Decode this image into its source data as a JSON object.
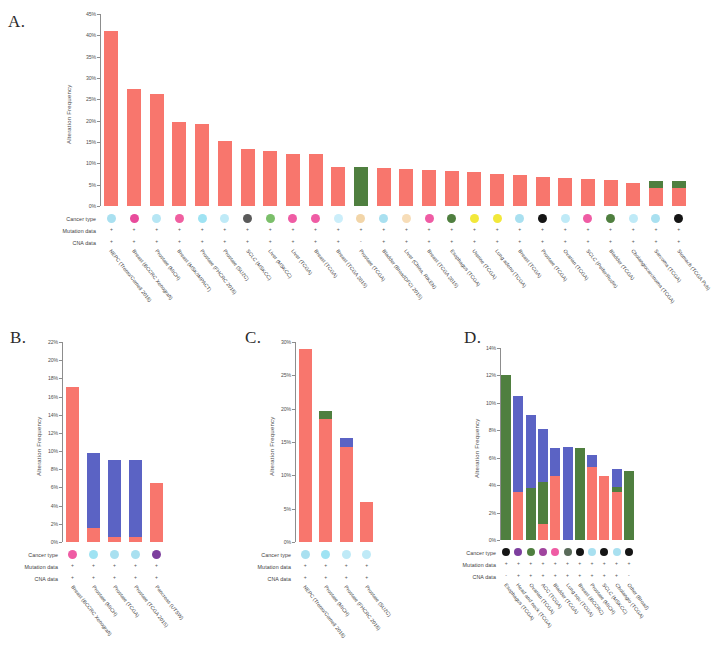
{
  "figure": {
    "axis_title": "Alteration Frequency",
    "row_labels": {
      "cancer_type": "Cancer type",
      "mutation_data": "Mutation data",
      "cna_data": "CNA data"
    },
    "present_mark": "+",
    "absent_mark": "-",
    "colors": {
      "mutation": "#f8766d",
      "amplification": "#4f7f3f",
      "deletion": "#5b63c4",
      "axis": "#8d8d8d",
      "text": "#3c3c3c"
    },
    "legend_meaning": {
      "orange": "Mutation",
      "green": "Amplification",
      "blue": "Deep Deletion"
    }
  },
  "panels": [
    {
      "letter": "A.",
      "name": "panel-a",
      "chart_data": {
        "type": "bar",
        "title": "",
        "xlabel": "",
        "ylabel": "Alteration Frequency",
        "ylim": [
          0,
          45
        ],
        "yticks": [
          "0%",
          "5%",
          "10%",
          "15%",
          "20%",
          "25%",
          "30%",
          "35%",
          "40%",
          "45%"
        ],
        "ytick_values": [
          0,
          5,
          10,
          15,
          20,
          25,
          30,
          35,
          40,
          45
        ],
        "grid": false,
        "stacked": true,
        "series": [
          {
            "name": "Mutation",
            "color": "#f8766d",
            "values": [
              41.0,
              27.5,
              26.2,
              19.8,
              19.2,
              15.2,
              13.3,
              13.0,
              12.2,
              12.1,
              9.2,
              0.0,
              9.0,
              8.6,
              8.5,
              8.3,
              8.0,
              7.6,
              7.3,
              6.7,
              6.5,
              6.3,
              6.0,
              5.4,
              4.3,
              4.2
            ]
          },
          {
            "name": "Amplification",
            "color": "#4f7f3f",
            "values": [
              0,
              0,
              0,
              0,
              0,
              0,
              0,
              0,
              0,
              0,
              0,
              9.1,
              0,
              0,
              0,
              0,
              0,
              0,
              0,
              0,
              0,
              0,
              0,
              0,
              1.6,
              1.6
            ]
          },
          {
            "name": "Deep Deletion",
            "color": "#5b63c4",
            "values": [
              0,
              0,
              0,
              0,
              0,
              0,
              0,
              0,
              0,
              0,
              0,
              0,
              0,
              0,
              0,
              0,
              0,
              0,
              0,
              0,
              0,
              0,
              0,
              0,
              0,
              0
            ]
          }
        ],
        "categories": [
          "NEPC (Trento/Cornell 2016)",
          "Breast (BCCRC Xenograft)",
          "Prostate (MICH)",
          "Breast (MSK/IMPACT)",
          "Prostate (FHCRC 2016)",
          "Prostate (SU2C)",
          "SCLC (MSKCC)",
          "Liver (MSKCC)",
          "Liver (TCGA)",
          "Breast (TCGA)",
          "Breast (TCGA 2015)",
          "Prostate (TCGA)",
          "Bladder (BroadDFCI 2015)",
          "Liver (China, RIKEN)",
          "Breast (TCGA 2015)",
          "Esophagus (TCGA)",
          "Uterine (TCGA)",
          "Lung adeno (TCGA)",
          "Breast (TCGA)",
          "Prostate (TCGA)",
          "Ovarian (TCGA)",
          "SCLC (Peifer/Rudin)",
          "Bladder (TCGA)",
          "Cholangiocarcinoma (TCGA)",
          "Sarcoma (TCGA)",
          "Stomach (TCGA Pub)"
        ],
        "cancer_type_colors": [
          "#a9e0f0",
          "#e84b9b",
          "#b6e6f4",
          "#f05fa0",
          "#9fe3f3",
          "#bfeaf7",
          "#5a5a5a",
          "#7bbf6a",
          "#ef5ca4",
          "#ef5ca4",
          "#cbeefa",
          "#f2d5a8",
          "#a9e0f0",
          "#f7ddb8",
          "#ef5ca4",
          "#4f7f3f",
          "#f2e83a",
          "#f2e83a",
          "#a9e0f0",
          "#151515",
          "#bfeaf7",
          "#ef5ca4",
          "#4f7f3f",
          "#bfeaf7",
          "#a9e0f0",
          "#151515"
        ],
        "mutation_data": [
          "+",
          "+",
          "+",
          "+",
          "+",
          "+",
          "+",
          "+",
          "+",
          "+",
          "+",
          "+",
          "+",
          "+",
          "+",
          "+",
          "+",
          "+",
          "+",
          "+",
          "+",
          "+",
          "+",
          "+",
          "+",
          "+"
        ],
        "cna_data": [
          "+",
          "+",
          "+",
          "+",
          "+",
          "+",
          "+",
          "+",
          "+",
          "+",
          "+",
          "-",
          "+",
          "+",
          "+",
          "+",
          "+",
          "+",
          "+",
          "+",
          "+",
          "+",
          "+",
          "+",
          "+",
          "+"
        ]
      }
    },
    {
      "letter": "B.",
      "name": "panel-b",
      "chart_data": {
        "type": "bar",
        "title": "",
        "xlabel": "",
        "ylabel": "Alteration Frequency",
        "ylim": [
          0,
          22
        ],
        "yticks": [
          "0%",
          "2%",
          "4%",
          "6%",
          "8%",
          "10%",
          "12%",
          "14%",
          "16%",
          "18%",
          "20%",
          "22%"
        ],
        "ytick_values": [
          0,
          2,
          4,
          6,
          8,
          10,
          12,
          14,
          16,
          18,
          20,
          22
        ],
        "grid": false,
        "stacked": true,
        "series": [
          {
            "name": "Mutation",
            "color": "#f8766d",
            "values": [
              17.0,
              1.5,
              0.6,
              0.6,
              6.5
            ]
          },
          {
            "name": "Amplification",
            "color": "#4f7f3f",
            "values": [
              0,
              0,
              0,
              0,
              0
            ]
          },
          {
            "name": "Deep Deletion",
            "color": "#5b63c4",
            "values": [
              0,
              8.3,
              8.4,
              8.4,
              0
            ]
          }
        ],
        "categories": [
          "Breast (BCCRC Xenograft)",
          "Prostate (MICH)",
          "Prostate (TCGA)",
          "Prostate (TCGA 2015)",
          "Pancreas (UTSW)"
        ],
        "cancer_type_colors": [
          "#ef5ca4",
          "#9fe3f3",
          "#a9e0f0",
          "#a9e0f0",
          "#7d3f9e"
        ],
        "mutation_data": [
          "+",
          "+",
          "+",
          "+",
          "+"
        ],
        "cna_data": [
          "+",
          "+",
          "+",
          "+",
          "+"
        ]
      }
    },
    {
      "letter": "C.",
      "name": "panel-c",
      "chart_data": {
        "type": "bar",
        "title": "",
        "xlabel": "",
        "ylabel": "Alteration Frequency",
        "ylim": [
          0,
          30
        ],
        "yticks": [
          "0%",
          "5%",
          "10%",
          "15%",
          "20%",
          "25%",
          "30%"
        ],
        "ytick_values": [
          0,
          5,
          10,
          15,
          20,
          25,
          30
        ],
        "grid": false,
        "stacked": true,
        "series": [
          {
            "name": "Mutation",
            "color": "#f8766d",
            "values": [
              29.0,
              18.5,
              14.3,
              6.0
            ]
          },
          {
            "name": "Amplification",
            "color": "#4f7f3f",
            "values": [
              0,
              1.2,
              0,
              0
            ]
          },
          {
            "name": "Deep Deletion",
            "color": "#5b63c4",
            "values": [
              0,
              0,
              1.3,
              0
            ]
          }
        ],
        "categories": [
          "NEPC (Trento/Cornell 2016)",
          "Prostate (MICH)",
          "Prostate (FHCRC 2016)",
          "Prostate (SU2C)"
        ],
        "cancer_type_colors": [
          "#a9e0f0",
          "#9fe3f3",
          "#bfeaf7",
          "#bfeaf7"
        ],
        "mutation_data": [
          "+",
          "+",
          "+",
          "+"
        ],
        "cna_data": [
          "+",
          "+",
          "+",
          "+"
        ]
      }
    },
    {
      "letter": "D.",
      "name": "panel-d",
      "chart_data": {
        "type": "bar",
        "title": "",
        "xlabel": "",
        "ylabel": "Alteration Frequency",
        "ylim": [
          0,
          14
        ],
        "yticks": [
          "0%",
          "2%",
          "4%",
          "6%",
          "8%",
          "10%",
          "12%",
          "14%"
        ],
        "ytick_values": [
          0,
          2,
          4,
          6,
          8,
          10,
          12,
          14
        ],
        "grid": false,
        "stacked": true,
        "series": [
          {
            "name": "Mutation",
            "color": "#f8766d",
            "values": [
              0.0,
              3.5,
              0.0,
              1.2,
              4.7,
              0.0,
              0.0,
              5.3,
              4.7,
              3.5,
              0.0
            ]
          },
          {
            "name": "Amplification",
            "color": "#4f7f3f",
            "values": [
              12.0,
              0.0,
              3.8,
              3.0,
              0.0,
              0.0,
              6.7,
              0.0,
              0.0,
              0.4,
              5.0
            ]
          },
          {
            "name": "Deep Deletion",
            "color": "#5b63c4",
            "values": [
              0.0,
              7.0,
              5.3,
              3.9,
              2.0,
              6.8,
              0.0,
              0.9,
              0.0,
              1.3,
              0.0
            ]
          }
        ],
        "categories": [
          "Esophagus (TCGA)",
          "Head and neck (TCGA)",
          "Ovarian (TCGA)",
          "ACC (TCGA)",
          "Bladder (TCGA)",
          "Lung squ (TCGA)",
          "Breast (BCCRC)",
          "Prostate (MICH)",
          "SCLC (MSKCC)",
          "Cholangio (TCGA)",
          "Other (Broad)"
        ],
        "cancer_type_colors": [
          "#151515",
          "#7d3f9e",
          "#4f7f3f",
          "#a0449e",
          "#ef5ca4",
          "#5a6b5a",
          "#151515",
          "#a9e0f0",
          "#151515",
          "#a9e0f0",
          "#151515"
        ],
        "mutation_data": [
          "+",
          "+",
          "+",
          "+",
          "+",
          "+",
          "+",
          "+",
          "+",
          "+",
          "+"
        ],
        "cna_data": [
          "-",
          "+",
          "+",
          "+",
          "+",
          "+",
          "+",
          "+",
          "+",
          "+",
          "-"
        ]
      }
    }
  ]
}
